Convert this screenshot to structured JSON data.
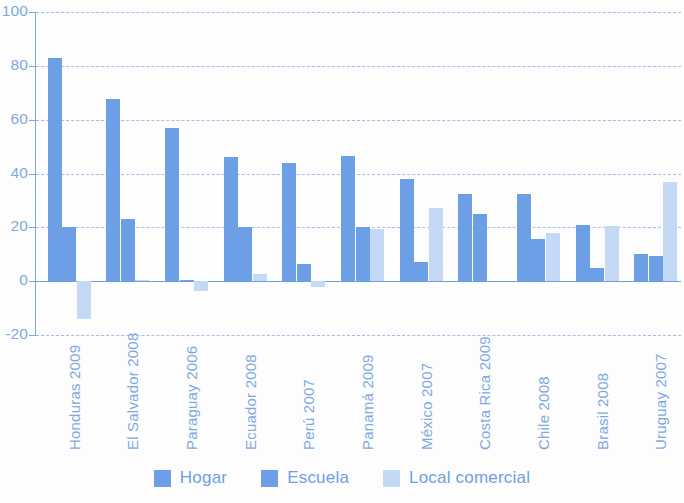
{
  "chart_data": {
    "type": "bar",
    "title": "",
    "subtitle": "",
    "xlabel": "",
    "ylabel": "",
    "ylim": [
      -20,
      100
    ],
    "yticks": [
      -20,
      0,
      20,
      40,
      60,
      80,
      100
    ],
    "ytick_labels": [
      "-20",
      "0",
      "20",
      "40",
      "60",
      "80",
      "100"
    ],
    "grid": true,
    "legend_position": "bottom",
    "categories": [
      "Honduras 2009",
      "El Salvador 2008",
      "Paraguay 2006",
      "Ecuador 2008",
      "Perú 2007",
      "Panamá 2009",
      "México 2007",
      "Costa Rica 2009",
      "Chile 2008",
      "Brasil 2008",
      "Uruguay 2007"
    ],
    "series": [
      {
        "name": "Hogar",
        "color": "#6d9fe6",
        "values": [
          83,
          67.5,
          57,
          46,
          44,
          46.5,
          38,
          32.5,
          32.5,
          21,
          10
        ]
      },
      {
        "name": "Escuela",
        "color": "#6d9fe6",
        "values": [
          20,
          23,
          0.5,
          20,
          6.5,
          20,
          7,
          25,
          15.5,
          5,
          9.5
        ]
      },
      {
        "name": "Local comercial",
        "color": "#c3d9f5",
        "values": [
          -14,
          0.3,
          -3.5,
          2.5,
          -2,
          19.5,
          27,
          null,
          18,
          20.5,
          37
        ]
      }
    ]
  },
  "legend": {
    "items": [
      {
        "label": "Hogar",
        "color": "#6d9fe6"
      },
      {
        "label": "Escuela",
        "color": "#6d9fe6"
      },
      {
        "label": "Local comercial",
        "color": "#c3d9f5"
      }
    ]
  },
  "colors": {
    "axis": "#7ba7e3",
    "grid": "#8fb4e8",
    "tick_text": "#7ea9e2",
    "bar_dark": "#6d9fe6",
    "bar_light": "#c3d9f5",
    "background": "#fdfdfd"
  }
}
